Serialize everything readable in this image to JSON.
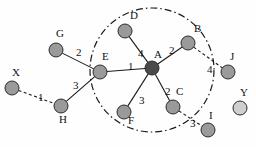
{
  "diagram": {
    "canvas": {
      "width": 256,
      "height": 147,
      "background": "#fefefe"
    },
    "cluster": {
      "shape": "circle",
      "cx": 152,
      "cy": 70,
      "r": 62,
      "stroke": "#1a1a1a",
      "style": "dash-dot"
    },
    "node_style": {
      "radius": 7,
      "fill_default": "#9a9a9a",
      "fill_center": "#4a4a4a",
      "fill_light": "#cfcfcf",
      "stroke": "#2b2b2b"
    },
    "nodes": [
      {
        "id": "A",
        "label": "A",
        "x": 152,
        "y": 68,
        "fill": "#4a4a4a",
        "label_dx": 2,
        "label_dy": -19,
        "inside": true
      },
      {
        "id": "B",
        "label": "B",
        "x": 188,
        "y": 43,
        "fill": "#9a9a9a",
        "label_dx": 6,
        "label_dy": -20,
        "inside": true
      },
      {
        "id": "C",
        "label": "C",
        "x": 173,
        "y": 107,
        "fill": "#9a9a9a",
        "label_dx": 3,
        "label_dy": -21,
        "inside": true
      },
      {
        "id": "D",
        "label": "D",
        "x": 125,
        "y": 31,
        "fill": "#9a9a9a",
        "label_dx": 5,
        "label_dy": -21,
        "inside": true
      },
      {
        "id": "E",
        "label": "E",
        "x": 100,
        "y": 72,
        "fill": "#9a9a9a",
        "label_dx": 2,
        "label_dy": -21,
        "inside": true
      },
      {
        "id": "F",
        "label": "F",
        "x": 124,
        "y": 112,
        "fill": "#9a9a9a",
        "label_dx": 4,
        "label_dy": 3,
        "inside": true
      },
      {
        "id": "G",
        "label": "G",
        "x": 56,
        "y": 50,
        "fill": "#9a9a9a",
        "label_dx": 0,
        "label_dy": -22,
        "inside": false
      },
      {
        "id": "H",
        "label": "H",
        "x": 61,
        "y": 106,
        "fill": "#9a9a9a",
        "label_dx": -2,
        "label_dy": 8,
        "inside": false
      },
      {
        "id": "X",
        "label": "X",
        "x": 12,
        "y": 88,
        "fill": "#9a9a9a",
        "label_dx": 0,
        "label_dy": -21,
        "inside": false
      },
      {
        "id": "J",
        "label": "J",
        "x": 228,
        "y": 72,
        "fill": "#9a9a9a",
        "label_dx": 2,
        "label_dy": -21,
        "inside": false
      },
      {
        "id": "Y",
        "label": "Y",
        "x": 240,
        "y": 108,
        "fill": "#cfcfcf",
        "label_dx": 0,
        "label_dy": -21,
        "inside": false
      },
      {
        "id": "I",
        "label": "I",
        "x": 208,
        "y": 130,
        "fill": "#9a9a9a",
        "label_dx": 1,
        "label_dy": -20,
        "inside": false
      }
    ],
    "edges": [
      {
        "from": "G",
        "to": "E",
        "weight": "2",
        "style": "solid",
        "lx": 76,
        "ly": 47
      },
      {
        "from": "H",
        "to": "E",
        "weight": "3",
        "style": "solid",
        "lx": 73,
        "ly": 80
      },
      {
        "from": "X",
        "to": "H",
        "weight": "1",
        "style": "dashed",
        "lx": 38,
        "ly": 92
      },
      {
        "from": "E",
        "to": "A",
        "weight": "1",
        "style": "solid",
        "lx": 128,
        "ly": 61
      },
      {
        "from": "D",
        "to": "A",
        "weight": "4",
        "style": "solid",
        "lx": 138,
        "ly": 48
      },
      {
        "from": "A",
        "to": "B",
        "weight": "2",
        "style": "solid",
        "lx": 169,
        "ly": 45
      },
      {
        "from": "B",
        "to": "J",
        "weight": "4",
        "style": "dashed",
        "lx": 207,
        "ly": 64
      },
      {
        "from": "A",
        "to": "C",
        "weight": "2",
        "style": "solid",
        "lx": 165,
        "ly": 86
      },
      {
        "from": "A",
        "to": "F",
        "weight": "3",
        "style": "solid",
        "lx": 139,
        "ly": 95
      },
      {
        "from": "C",
        "to": "I",
        "weight": "3",
        "style": "dashed",
        "lx": 190,
        "ly": 118
      }
    ]
  }
}
